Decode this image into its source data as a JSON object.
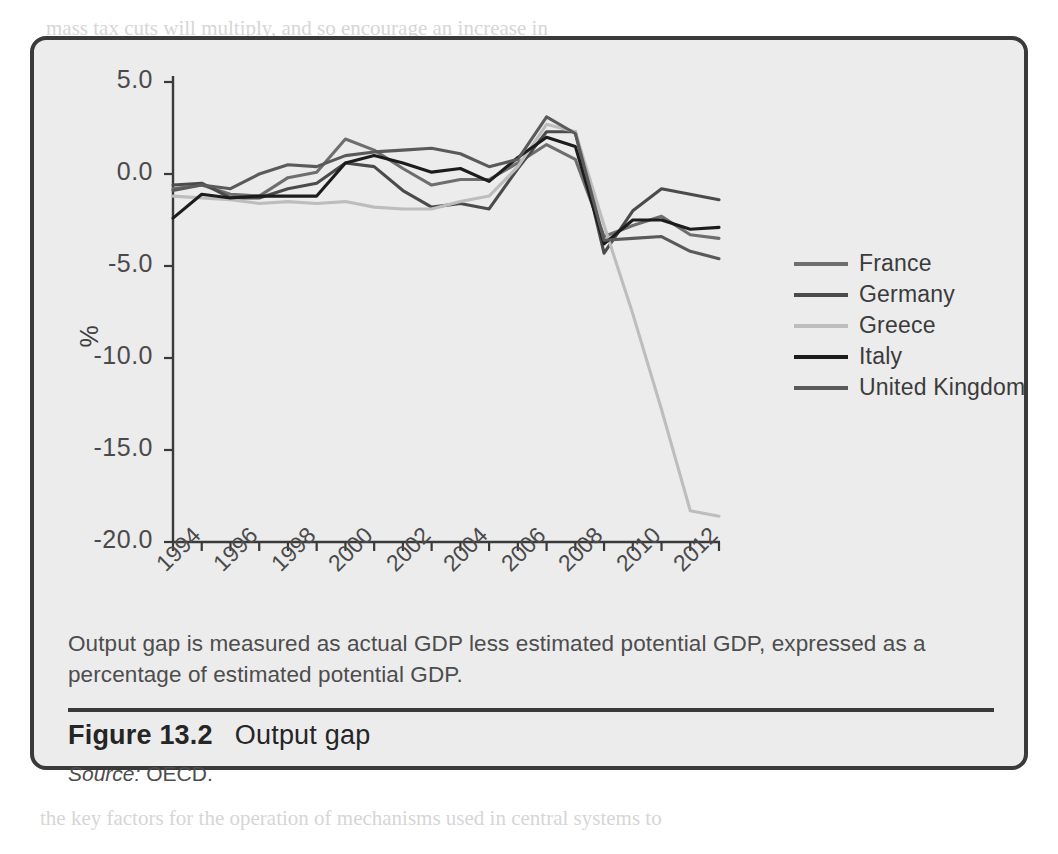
{
  "figure": {
    "number_label": "Figure 13.2",
    "title": "Output gap",
    "source_word": "Source:",
    "source_value": " OECD.",
    "note": "Output gap is measured as actual GDP less estimated potential GDP, expressed as a percentage of estimated potential GDP."
  },
  "chart_data": {
    "type": "line",
    "title": "Output gap",
    "xlabel": "",
    "ylabel": "%",
    "ylim": [
      -20.0,
      5.0
    ],
    "xlim": [
      1994,
      2013
    ],
    "grid": false,
    "legend_position": "right",
    "ytick_labels": [
      "5.0",
      "0.0",
      "-5.0",
      "-10.0",
      "-15.0",
      "-20.0"
    ],
    "ytick_values": [
      5.0,
      0.0,
      -5.0,
      -10.0,
      -15.0,
      -20.0
    ],
    "xtick_labels": [
      "1994",
      "1996",
      "1998",
      "2000",
      "2002",
      "2004",
      "2006",
      "2008",
      "2010",
      "2012"
    ],
    "xtick_values": [
      1994,
      1996,
      1998,
      2000,
      2002,
      2004,
      2006,
      2008,
      2010,
      2012
    ],
    "x": [
      1994,
      1995,
      1996,
      1997,
      1998,
      1999,
      2000,
      2001,
      2002,
      2003,
      2004,
      2005,
      2006,
      2007,
      2008,
      2009,
      2010,
      2011,
      2012,
      2013
    ],
    "series": [
      {
        "name": "France",
        "color": "#6e6e6e",
        "values": [
          -0.8,
          -0.6,
          -1.1,
          -1.2,
          -0.2,
          0.1,
          1.9,
          1.3,
          0.3,
          -0.6,
          -0.3,
          -0.3,
          0.6,
          1.6,
          0.8,
          -3.4,
          -2.8,
          -2.3,
          -3.3,
          -3.5
        ]
      },
      {
        "name": "Germany",
        "color": "#4b4b4b",
        "values": [
          -0.6,
          -0.5,
          -1.3,
          -1.3,
          -0.8,
          -0.5,
          0.6,
          0.4,
          -0.9,
          -1.8,
          -1.6,
          -1.9,
          0.3,
          2.3,
          2.3,
          -4.3,
          -2.0,
          -0.8,
          -1.1,
          -1.4
        ]
      },
      {
        "name": "Greece",
        "color": "#bdbdbd",
        "values": [
          -1.2,
          -1.3,
          -1.4,
          -1.6,
          -1.5,
          -1.6,
          -1.5,
          -1.8,
          -1.9,
          -1.9,
          -1.5,
          -1.2,
          0.4,
          2.7,
          2.3,
          -2.8,
          -7.6,
          -12.8,
          -18.3,
          -18.6
        ]
      },
      {
        "name": "Italy",
        "color": "#1c1c1c",
        "values": [
          -2.4,
          -1.1,
          -1.3,
          -1.2,
          -1.2,
          -1.2,
          0.6,
          1.0,
          0.6,
          0.1,
          0.3,
          -0.4,
          0.9,
          2.0,
          1.5,
          -3.8,
          -2.5,
          -2.5,
          -3.0,
          -2.9
        ]
      },
      {
        "name": "United Kingdom",
        "color": "#5a5a5a",
        "values": [
          -0.9,
          -0.6,
          -0.8,
          0.0,
          0.5,
          0.4,
          1.0,
          1.2,
          1.3,
          1.4,
          1.1,
          0.4,
          0.8,
          3.1,
          2.2,
          -3.6,
          -3.5,
          -3.4,
          -4.2,
          -4.6
        ]
      }
    ]
  },
  "legend": {
    "items": [
      {
        "label": "France",
        "color": "#6e6e6e"
      },
      {
        "label": "Germany",
        "color": "#4b4b4b"
      },
      {
        "label": "Greece",
        "color": "#bdbdbd"
      },
      {
        "label": "Italy",
        "color": "#1c1c1c"
      },
      {
        "label": "United Kingdom",
        "color": "#5a5a5a"
      }
    ]
  },
  "bleed_text": {
    "lines": [
      "mass tax cuts will multiply, and so encourage an increase in",
      "in the functioning of the economy both in the short term and in reducing uncert",
      "return to a long-run growth path in line with its potential output",
      "the set with which they cannot will prove to be in the long term.",
      "between behaviour and market conditions have at times to an unexpected pe",
      "the determination of the structure of goods and labour markets and",
      "provide a balance between the short-run impacts upon",
      "macroeconomy. The analysis will then be extended to provide you with an understand",
      "of the way in which the goods, labour and money and the stock market in part",
      "the degree of wage-bargaining will also be affected followed by a review of different",
      "main perspective of how quickly the economy will adjust to long-run equilibrium.",
      "In Chapter 1 and 2 we looked at short and long-run equilibrium",
      "these previous chapters showed the key of the macroeconomy and its structure. In Cha",
      "an economy with long-run equilibrium and the levels of",
      "hold and firms, governments and enterprises that are willing to be",
      "output, labour and people that economies wish to be able to fit supply",
      "the key factors for the operation of mechanisms used in central systems to"
    ],
    "heading": "Short and long-run macroeconomic equilibrium"
  }
}
